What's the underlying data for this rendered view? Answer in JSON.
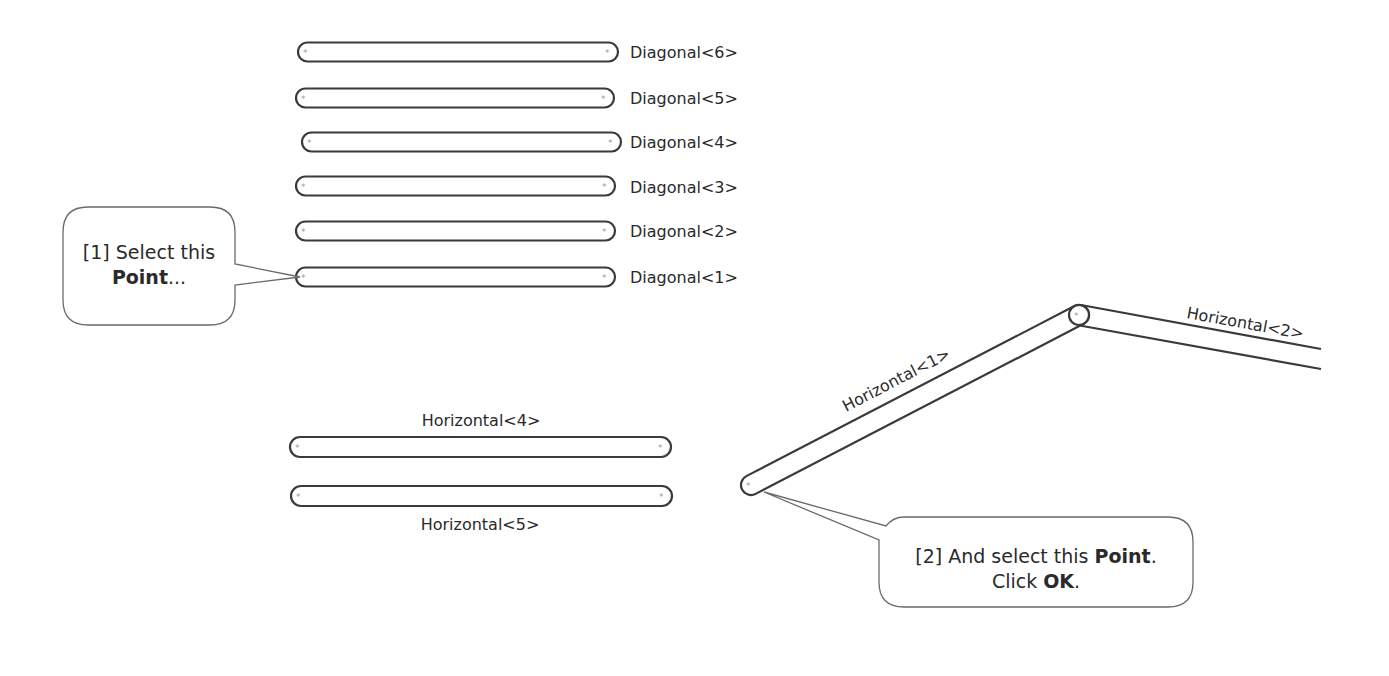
{
  "diagram": {
    "type": "truss-member-selection-tutorial",
    "diagonal_members": [
      {
        "label": "Diagonal<6>",
        "x1": 307,
        "x2": 609,
        "y": 52
      },
      {
        "label": "Diagonal<5>",
        "x1": 305,
        "x2": 605,
        "y": 98
      },
      {
        "label": "Diagonal<4>",
        "x1": 311,
        "x2": 612,
        "y": 142
      },
      {
        "label": "Diagonal<3>",
        "x1": 305,
        "x2": 606,
        "y": 186
      },
      {
        "label": "Diagonal<2>",
        "x1": 305,
        "x2": 606,
        "y": 231
      },
      {
        "label": "Diagonal<1>",
        "x1": 305,
        "x2": 606,
        "y": 277
      }
    ],
    "horizontal_members": [
      {
        "label": "Horizontal<4>",
        "x1": 300,
        "x2": 661,
        "y": 447,
        "label_position": "above"
      },
      {
        "label": "Horizontal<5>",
        "x1": 301,
        "x2": 662,
        "y": 496,
        "label_position": "below"
      }
    ],
    "frame_members": [
      {
        "label": "Horizontal<1>",
        "from": [
          751,
          485
        ],
        "to": [
          1079,
          315
        ]
      },
      {
        "label": "Horizontal<2>",
        "from": [
          1079,
          315
        ],
        "to": [
          1321,
          359
        ]
      }
    ],
    "callouts": [
      {
        "step": "[1]",
        "lines": [
          [
            {
              "text": "[1] Select this",
              "bold": false
            }
          ],
          [
            {
              "text": "Point",
              "bold": true
            },
            {
              "text": "...",
              "bold": false
            }
          ]
        ],
        "points_to": "Diagonal<1> left end point"
      },
      {
        "step": "[2]",
        "lines": [
          [
            {
              "text": "[2] And select this ",
              "bold": false
            },
            {
              "text": "Point",
              "bold": true
            },
            {
              "text": ".",
              "bold": false
            }
          ],
          [
            {
              "text": "Click ",
              "bold": false
            },
            {
              "text": "OK",
              "bold": true
            },
            {
              "text": ".",
              "bold": false
            }
          ]
        ],
        "points_to": "Horizontal<1> lower-left end point"
      }
    ],
    "joint_marker": "*",
    "colors": {
      "background": "#ffffff",
      "member_outline": "#3a3a3a",
      "joint_marker": "#9a9a9a",
      "callout_border": "#6a6a6a",
      "text": "#2a2a2a"
    }
  }
}
